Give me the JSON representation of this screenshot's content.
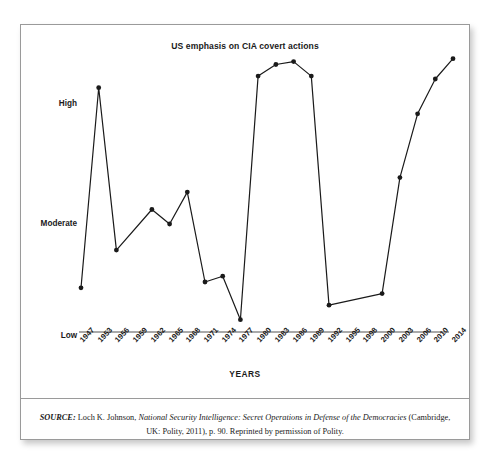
{
  "figure": {
    "title": "US emphasis on CIA covert actions",
    "xaxis_name": "YEARS",
    "caption": {
      "source_label": "SOURCE:",
      "author": "Loch K. Johnson,",
      "work_title": "National Security Intelligence: Secret Operations in Defense of the Democracies",
      "publication": "(Cambridge, UK: Polity, 2011), p. 90. Reprinted by permission of Polity."
    }
  },
  "chart_data": {
    "type": "line",
    "title": "US emphasis on CIA covert actions",
    "xlabel": "YEARS",
    "ylabel": "",
    "grid": false,
    "legend": null,
    "ytick_labels": [
      "High",
      "Moderate",
      "Low"
    ],
    "ytick_values": [
      90,
      50,
      10
    ],
    "ylim": [
      0,
      100
    ],
    "categories": [
      "1947",
      "1953",
      "1956",
      "1959",
      "1962",
      "1965",
      "1968",
      "1971",
      "1974",
      "1977",
      "1980",
      "1983",
      "1986",
      "1989",
      "1992",
      "1995",
      "1998",
      "2000",
      "2003",
      "2006",
      "2010",
      "2014"
    ],
    "marked_points": [
      "1947",
      "1953",
      "1956",
      "1962",
      "1965",
      "1968",
      "1971",
      "1974",
      "1977",
      "1980",
      "1983",
      "1986",
      "1989",
      "1992",
      "2000",
      "2003",
      "2006",
      "2010",
      "2014"
    ],
    "values": [
      18,
      87,
      31,
      null,
      45,
      40,
      51,
      20,
      22,
      7,
      91,
      95,
      96,
      91,
      12,
      null,
      null,
      16,
      56,
      78,
      90,
      97
    ],
    "series": [
      {
        "name": "US emphasis on CIA covert actions",
        "points": [
          {
            "x": "1947",
            "y": 18
          },
          {
            "x": "1953",
            "y": 87
          },
          {
            "x": "1956",
            "y": 31
          },
          {
            "x": "1962",
            "y": 45
          },
          {
            "x": "1965",
            "y": 40
          },
          {
            "x": "1968",
            "y": 51
          },
          {
            "x": "1971",
            "y": 20
          },
          {
            "x": "1974",
            "y": 22
          },
          {
            "x": "1977",
            "y": 7
          },
          {
            "x": "1980",
            "y": 91
          },
          {
            "x": "1983",
            "y": 95
          },
          {
            "x": "1986",
            "y": 96
          },
          {
            "x": "1989",
            "y": 91
          },
          {
            "x": "1992",
            "y": 12
          },
          {
            "x": "2000",
            "y": 16
          },
          {
            "x": "2003",
            "y": 56
          },
          {
            "x": "2006",
            "y": 78
          },
          {
            "x": "2010",
            "y": 90
          },
          {
            "x": "2014",
            "y": 97
          }
        ]
      }
    ],
    "colors": {
      "line": "#1a1a1a",
      "marker": "#1a1a1a",
      "axis": "#555555",
      "background": "#ffffff"
    }
  }
}
